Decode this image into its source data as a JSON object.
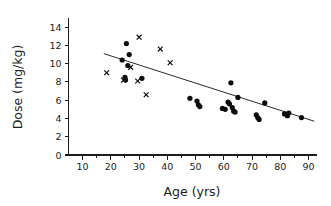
{
  "chart_data": {
    "type": "scatter",
    "title": "",
    "xlabel": "Age (yrs)",
    "ylabel": "Dose (mg/kg)",
    "xlim": [
      5,
      93
    ],
    "ylim": [
      0,
      15
    ],
    "grid": false,
    "legend": null,
    "x_ticks": [
      10,
      20,
      30,
      40,
      50,
      60,
      70,
      80,
      90
    ],
    "x_tick_labels": [
      "10",
      "20",
      "30",
      "40",
      "50",
      "60",
      "70",
      "80",
      "90"
    ],
    "x_minor_ticks": [
      15,
      25,
      35,
      45,
      55,
      65,
      75,
      85
    ],
    "y_ticks": [
      0,
      2,
      4,
      6,
      8,
      10,
      12,
      14
    ],
    "y_tick_labels": [
      "0",
      "2",
      "4",
      "6",
      "8",
      "10",
      "12",
      "14"
    ],
    "series": [
      {
        "name": "filled-circle-group",
        "marker": "circle",
        "color": "#0d0d0d",
        "points": [
          [
            24.0,
            10.4
          ],
          [
            25.5,
            12.2
          ],
          [
            26.5,
            11.0
          ],
          [
            25.0,
            8.5
          ],
          [
            25.2,
            8.2
          ],
          [
            31.0,
            8.4
          ],
          [
            26.0,
            9.8
          ],
          [
            48.0,
            6.2
          ],
          [
            50.5,
            5.9
          ],
          [
            51.0,
            5.5
          ],
          [
            51.5,
            5.3
          ],
          [
            59.5,
            5.1
          ],
          [
            60.5,
            5.0
          ],
          [
            61.5,
            5.8
          ],
          [
            62.0,
            5.6
          ],
          [
            62.5,
            7.9
          ],
          [
            63.0,
            5.2
          ],
          [
            63.5,
            4.8
          ],
          [
            64.0,
            4.7
          ],
          [
            65.0,
            6.3
          ],
          [
            71.5,
            4.4
          ],
          [
            72.0,
            4.1
          ],
          [
            72.5,
            3.9
          ],
          [
            74.5,
            5.7
          ],
          [
            81.5,
            4.5
          ],
          [
            82.5,
            4.3
          ],
          [
            83.0,
            4.6
          ],
          [
            87.5,
            4.1
          ]
        ]
      },
      {
        "name": "cross-group",
        "marker": "x",
        "color": "#0d0d0d",
        "points": [
          [
            18.5,
            9.0
          ],
          [
            24.5,
            8.2
          ],
          [
            27.0,
            9.6
          ],
          [
            29.5,
            8.1
          ],
          [
            30.0,
            12.9
          ],
          [
            32.5,
            6.6
          ],
          [
            37.5,
            11.6
          ],
          [
            41.0,
            10.1
          ]
        ]
      }
    ],
    "trend_line": {
      "name": "regression-line",
      "x_start": 17.5,
      "y_start": 11.1,
      "x_end": 92.0,
      "y_end": 3.7
    }
  }
}
